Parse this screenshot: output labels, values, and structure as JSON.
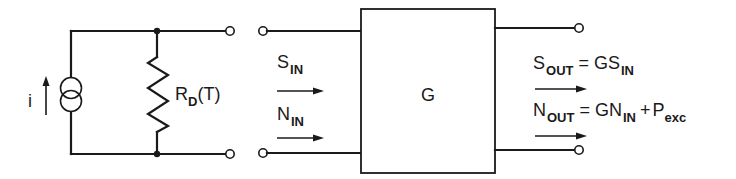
{
  "diagram": {
    "type": "circuit-block-diagram",
    "source": {
      "current_label": "i",
      "resistor_label_main": "R",
      "resistor_label_sub": "D",
      "resistor_label_arg": "(T)"
    },
    "block": {
      "label": "G"
    },
    "inputs": {
      "signal": {
        "main": "S",
        "sub": "IN"
      },
      "noise": {
        "main": "N",
        "sub": "IN"
      }
    },
    "outputs": {
      "signal": {
        "main": "S",
        "sub": "OUT",
        "eq": "=",
        "rhs_main": "GS",
        "rhs_sub": "IN"
      },
      "noise": {
        "main": "N",
        "sub": "OUT",
        "eq": "=",
        "rhs_main": "GN",
        "rhs_sub": "IN",
        "plus": "+",
        "term_main": "P",
        "term_sub": "exc"
      }
    },
    "colors": {
      "line": "#1a1a1a",
      "background": "#ffffff"
    }
  }
}
